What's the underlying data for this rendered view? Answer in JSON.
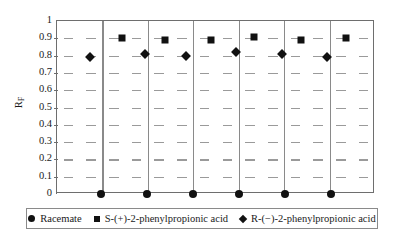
{
  "chart_data": {
    "type": "scatter",
    "title": "",
    "xlabel": "",
    "ylabel": "RF",
    "ylabel_base": "R",
    "ylabel_sub": "F",
    "ylim": [
      0,
      1
    ],
    "ytick_labels": [
      "1",
      "0.9",
      "0.8",
      "0.7",
      "0.6",
      "0.5",
      "0.4",
      "0.3",
      "0.2",
      "0.1",
      "0"
    ],
    "ytick_values": [
      1,
      0.9,
      0.8,
      0.7,
      0.6,
      0.5,
      0.4,
      0.3,
      0.2,
      0.1,
      0
    ],
    "grid": "horizontal-dashed",
    "panel_count": 7,
    "legend_position": "bottom",
    "series": [
      {
        "name": "Racemate",
        "marker": "circle",
        "color": "#111111",
        "values": [
          0,
          0,
          0,
          0,
          0,
          0
        ]
      },
      {
        "name": "S-(+)-2-phenylpropionic acid",
        "marker": "square",
        "color": "#111111",
        "values": [
          0.9,
          0.89,
          0.89,
          0.91,
          0.89,
          0.9
        ]
      },
      {
        "name": "R-(−)-2-phenylpropionic acid",
        "marker": "diamond",
        "color": "#111111",
        "values": [
          0.79,
          0.81,
          0.8,
          0.82,
          0.81,
          0.79
        ]
      }
    ],
    "points": [
      {
        "series": "R-(−)-2-phenylpropionic acid",
        "panel": 1,
        "x_px": 89,
        "value": 0.79
      },
      {
        "series": "S-(+)-2-phenylpropionic acid",
        "panel": 2,
        "x_px": 121,
        "value": 0.9
      },
      {
        "series": "Racemate",
        "panel": 2,
        "x_px": 100,
        "value": 0
      },
      {
        "series": "R-(−)-2-phenylpropionic acid",
        "panel": 2,
        "x_px": 144,
        "value": 0.81
      },
      {
        "series": "S-(+)-2-phenylpropionic acid",
        "panel": 3,
        "x_px": 164,
        "value": 0.89
      },
      {
        "series": "Racemate",
        "panel": 3,
        "x_px": 146,
        "value": 0
      },
      {
        "series": "R-(−)-2-phenylpropionic acid",
        "panel": 3,
        "x_px": 185,
        "value": 0.8
      },
      {
        "series": "S-(+)-2-phenylpropionic acid",
        "panel": 4,
        "x_px": 210,
        "value": 0.89
      },
      {
        "series": "Racemate",
        "panel": 4,
        "x_px": 192,
        "value": 0
      },
      {
        "series": "R-(−)-2-phenylpropionic acid",
        "panel": 4,
        "x_px": 235,
        "value": 0.82
      },
      {
        "series": "S-(+)-2-phenylpropionic acid",
        "panel": 5,
        "x_px": 253,
        "value": 0.91
      },
      {
        "series": "Racemate",
        "panel": 5,
        "x_px": 238,
        "value": 0
      },
      {
        "series": "R-(−)-2-phenylpropionic acid",
        "panel": 5,
        "x_px": 281,
        "value": 0.81
      },
      {
        "series": "S-(+)-2-phenylpropionic acid",
        "panel": 6,
        "x_px": 300,
        "value": 0.89
      },
      {
        "series": "Racemate",
        "panel": 6,
        "x_px": 284,
        "value": 0
      },
      {
        "series": "R-(−)-2-phenylpropionic acid",
        "panel": 6,
        "x_px": 326,
        "value": 0.79
      },
      {
        "series": "S-(+)-2-phenylpropionic acid",
        "panel": 7,
        "x_px": 345,
        "value": 0.9
      },
      {
        "series": "Racemate",
        "panel": 7,
        "x_px": 330,
        "value": 0
      }
    ]
  },
  "legend": {
    "items": [
      {
        "marker": "circle",
        "label": "Racemate"
      },
      {
        "marker": "square",
        "label": "S-(+)-2-phenylpropionic acid"
      },
      {
        "marker": "diamond",
        "label": "R-(−)-2-phenylpropionic acid"
      }
    ]
  }
}
